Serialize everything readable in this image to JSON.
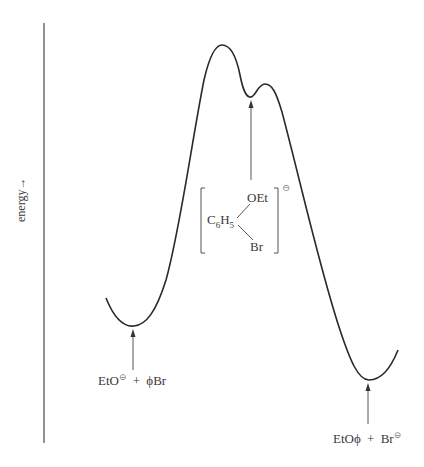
{
  "diagram": {
    "type": "reaction-energy-profile",
    "y_axis_label": "energy→",
    "reactants": {
      "label_main": "EtO",
      "label_charge": "⊝",
      "label_plus": "+",
      "label_rest": "ϕBr"
    },
    "products": {
      "label_main": "EtOϕ",
      "label_plus": "+",
      "label_rest": "Br",
      "label_charge": "⊝"
    },
    "intermediate": {
      "top_group": "OEt",
      "left_group_c": "C",
      "left_group_c_sub": "6",
      "left_group_h": "H",
      "left_group_h_sub": "5",
      "bottom_group": "Br",
      "charge": "⊝"
    },
    "features": [
      "reactant minimum",
      "first transition state (higher)",
      "intermediate minimum",
      "second transition state (lower)",
      "product minimum"
    ],
    "colors": {
      "curve": "#2a2a2a",
      "axis": "#555555",
      "arrow": "#555555",
      "text": "#3a3a3a"
    }
  }
}
